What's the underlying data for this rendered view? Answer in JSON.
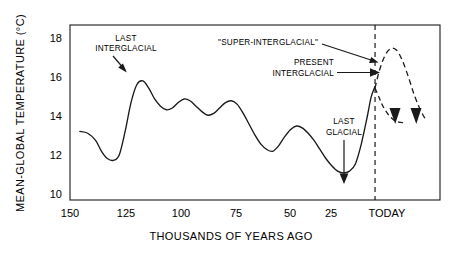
{
  "chart_data": {
    "type": "line",
    "title": "",
    "xlabel": "THOUSANDS OF YEARS AGO",
    "ylabel": "MEAN-GLOBAL TEMPERATURE (°C)",
    "x_tick_labels": [
      "150",
      "125",
      "100",
      "75",
      "50",
      "25",
      "TODAY"
    ],
    "x_tick_values": [
      150,
      125,
      100,
      75,
      50,
      25,
      0
    ],
    "y_tick_labels": [
      "18",
      "16",
      "14",
      "12",
      "10"
    ],
    "y_tick_values": [
      18,
      16,
      14,
      12,
      10
    ],
    "xlim": [
      155,
      -33
    ],
    "ylim": [
      9.2,
      18.9
    ],
    "x_axis_direction": "reversed",
    "grid": false,
    "legend": false,
    "series": [
      {
        "name": "Mean-global temperature (reconstructed)",
        "style": "solid",
        "x": [
          150,
          146,
          142,
          139,
          136,
          133,
          130,
          127,
          124,
          121,
          118,
          115,
          112,
          109,
          106,
          103,
          100,
          97,
          94,
          91,
          88,
          85,
          82,
          79,
          76,
          73,
          70,
          67,
          64,
          61,
          58,
          55,
          52,
          49,
          46,
          43,
          40,
          37,
          34,
          31,
          28,
          25,
          22,
          19,
          16,
          13,
          10,
          7,
          4,
          2,
          0
        ],
        "y": [
          13.0,
          12.9,
          12.5,
          11.9,
          11.5,
          11.4,
          11.7,
          13.0,
          14.6,
          15.6,
          15.8,
          15.4,
          14.8,
          14.4,
          14.2,
          14.3,
          14.6,
          14.8,
          14.7,
          14.4,
          14.1,
          13.9,
          14.0,
          14.3,
          14.6,
          14.7,
          14.5,
          14.0,
          13.4,
          12.8,
          12.3,
          12.0,
          11.9,
          12.2,
          12.7,
          13.1,
          13.3,
          13.2,
          12.9,
          12.5,
          12.0,
          11.5,
          11.1,
          10.8,
          10.7,
          10.8,
          11.2,
          12.3,
          13.8,
          14.9,
          15.5
        ]
      },
      {
        "name": "Super-interglacial projection",
        "style": "dashed",
        "x": [
          0,
          -2,
          -5,
          -8,
          -11,
          -14,
          -17,
          -20,
          -23,
          -26
        ],
        "y": [
          15.4,
          16.3,
          17.2,
          17.6,
          17.5,
          16.9,
          16.0,
          15.0,
          14.2,
          13.6
        ]
      },
      {
        "name": "Cooling projection",
        "style": "dashed",
        "x": [
          0,
          -2,
          -4,
          -7,
          -10,
          -13,
          -15
        ],
        "y": [
          15.4,
          14.9,
          14.4,
          13.9,
          13.6,
          13.5,
          13.5
        ]
      }
    ],
    "vertical_reference_line": {
      "label": "TODAY",
      "x": 0,
      "style": "dashed"
    },
    "annotations": [
      {
        "id": "last-interglacial",
        "text": [
          "LAST",
          "INTERGLACIAL"
        ],
        "arrow": "diagonal-down-right",
        "points_to_x": 127,
        "points_to_y": 15.8
      },
      {
        "id": "super-interglacial",
        "text": [
          "\"SUPER-INTERGLACIAL\""
        ],
        "arrow": "diagonal-down-right",
        "points_to_x": -4,
        "points_to_y": 16.8
      },
      {
        "id": "present-interglacial",
        "text": [
          "PRESENT",
          "INTERGLACIAL"
        ],
        "arrow": "horizontal-right",
        "points_to_x": 0,
        "points_to_y": 15.4
      },
      {
        "id": "last-glacial",
        "text": [
          "LAST",
          "GLACIAL"
        ],
        "arrow": "vertical-down",
        "points_to_x": 17,
        "points_to_y": 10.75
      }
    ]
  },
  "axis": {
    "y_title": "MEAN-GLOBAL  TEMPERATURE  (°C)",
    "x_title": "THOUSANDS OF YEARS AGO"
  },
  "ticks": {
    "x": [
      {
        "label": "150"
      },
      {
        "label": "125"
      },
      {
        "label": "100"
      },
      {
        "label": "75"
      },
      {
        "label": "50"
      },
      {
        "label": "25"
      },
      {
        "label": "TODAY"
      }
    ],
    "y": [
      {
        "label": "18"
      },
      {
        "label": "16"
      },
      {
        "label": "14"
      },
      {
        "label": "12"
      },
      {
        "label": "10"
      }
    ]
  },
  "annotations": {
    "last_interglacial_line1": "LAST",
    "last_interglacial_line2": "INTERGLACIAL",
    "super_interglacial": "\"SUPER-INTERGLACIAL\"",
    "present_interglacial_line1": "PRESENT",
    "present_interglacial_line2": "INTERGLACIAL",
    "last_glacial_line1": "LAST",
    "last_glacial_line2": "GLACIAL"
  },
  "colors": {
    "line": "#1a1a1a",
    "frame": "#1a1a1a",
    "background": "#ffffff",
    "text": "#000000"
  }
}
